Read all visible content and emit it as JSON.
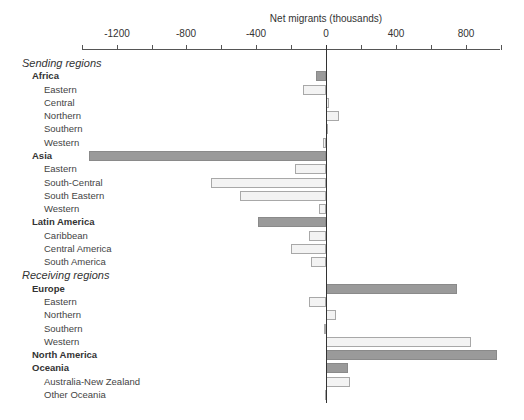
{
  "chart_data": {
    "type": "bar",
    "orientation": "horizontal",
    "title": "",
    "xlabel": "Net migrants (thousands)",
    "ylabel": "",
    "xlim": [
      -1400,
      1000
    ],
    "xticks": [
      -1400,
      -1200,
      -1000,
      -800,
      -600,
      -400,
      -200,
      0,
      200,
      400,
      600,
      800,
      1000
    ],
    "xtick_labels": [
      "-1200",
      "-800",
      "-400",
      "0",
      "400",
      "800"
    ],
    "xtick_label_values": [
      -1200,
      -800,
      -400,
      0,
      400,
      800
    ],
    "grid": false,
    "legend": null,
    "colors": {
      "region": "#9a9a9a",
      "subregion": "#f3f3f3",
      "subregion_border": "#a8a8a8"
    },
    "rows": [
      {
        "label": "Sending regions",
        "level": "section",
        "value": null
      },
      {
        "label": "Africa",
        "level": "region",
        "value": -60
      },
      {
        "label": "Eastern",
        "level": "sub",
        "value": -130
      },
      {
        "label": "Central",
        "level": "sub",
        "value": 15
      },
      {
        "label": "Northern",
        "level": "sub",
        "value": 75
      },
      {
        "label": "Southern",
        "level": "sub",
        "value": 5
      },
      {
        "label": "Western",
        "level": "sub",
        "value": -15
      },
      {
        "label": "Asia",
        "level": "region",
        "value": -1360
      },
      {
        "label": "Eastern",
        "level": "sub",
        "value": -175
      },
      {
        "label": "South-Central",
        "level": "sub",
        "value": -660
      },
      {
        "label": "South Eastern",
        "level": "sub",
        "value": -490
      },
      {
        "label": "Western",
        "level": "sub",
        "value": -40
      },
      {
        "label": "Latin America",
        "level": "region",
        "value": -390
      },
      {
        "label": "Caribbean",
        "level": "sub",
        "value": -100
      },
      {
        "label": "Central America",
        "level": "sub",
        "value": -200
      },
      {
        "label": "South America",
        "level": "sub",
        "value": -85
      },
      {
        "label": "Receiving regions",
        "level": "section",
        "value": null
      },
      {
        "label": "Europe",
        "level": "region",
        "value": 750
      },
      {
        "label": "Eastern",
        "level": "sub",
        "value": -100
      },
      {
        "label": "Northern",
        "level": "sub",
        "value": 55
      },
      {
        "label": "Southern",
        "level": "sub",
        "value": -10
      },
      {
        "label": "Western",
        "level": "sub",
        "value": 830
      },
      {
        "label": "North America",
        "level": "region",
        "value": 980
      },
      {
        "label": "Oceania",
        "level": "region",
        "value": 125
      },
      {
        "label": "Australia-New Zealand",
        "level": "sub",
        "value": 135
      },
      {
        "label": "Other Oceania",
        "level": "sub",
        "value": -5
      }
    ]
  }
}
